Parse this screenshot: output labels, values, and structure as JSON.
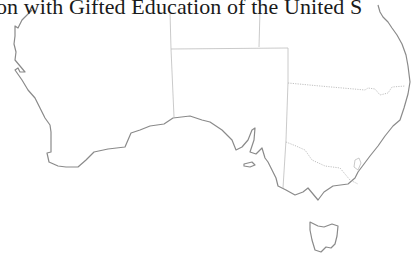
{
  "title": "on with Gifted Education of the United S",
  "map": {
    "subject": "Australia outline map",
    "regions": [
      "Western Australia",
      "Northern Territory",
      "South Australia",
      "Queensland",
      "New South Wales",
      "Australian Capital Territory",
      "Victoria",
      "Tasmania"
    ],
    "colors": {
      "coastline": "#8a8a8a",
      "borders": "#bdbdbd",
      "background": "#ffffff",
      "text": "#1a1a1a"
    }
  }
}
